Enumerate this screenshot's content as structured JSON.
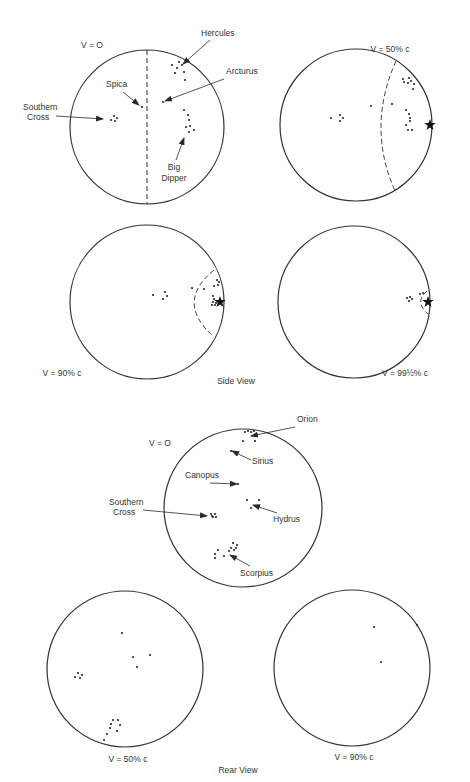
{
  "figure": {
    "side_view": {
      "caption": "Side View",
      "caption_pos": [
        236,
        384
      ],
      "panels": [
        {
          "id": "side-v0",
          "velocity_label": "V = O",
          "label_pos": [
            92,
            48
          ],
          "center": [
            147,
            127
          ],
          "radius": 77,
          "boundary": {
            "type": "line",
            "x1": 147,
            "y1": 50,
            "x2": 147,
            "y2": 204
          },
          "stars": [
            [
              111,
              120
            ],
            [
              114,
              116
            ],
            [
              117,
              118
            ],
            [
              115,
              121
            ],
            [
              142,
              107
            ],
            [
              163,
              102
            ],
            [
              172,
              65
            ],
            [
              179,
              62
            ],
            [
              182,
              65
            ],
            [
              177,
              68
            ],
            [
              184,
              72
            ],
            [
              175,
              73
            ],
            [
              185,
              80
            ],
            [
              184,
              110
            ],
            [
              188,
              115
            ],
            [
              189,
              120
            ],
            [
              190,
              126
            ],
            [
              186,
              127
            ],
            [
              189,
              132
            ],
            [
              194,
              130
            ]
          ],
          "bright_star": null,
          "labels": [
            {
              "text": "Hercules",
              "pos": [
                201,
                36
              ],
              "anchor": "start",
              "arrow": [
                [
                  210,
                  40
                ],
                [
                  183,
                  64
                ]
              ]
            },
            {
              "text": "Arcturus",
              "pos": [
                226,
                74
              ],
              "anchor": "start",
              "arrow": [
                [
                  224,
                  79
                ],
                [
                  165,
                  101
                ]
              ]
            },
            {
              "text": "Spica",
              "pos": [
                106,
                87
              ],
              "anchor": "start",
              "arrow": [
                [
                  123,
                  92
                ],
                [
                  139,
                  105
                ]
              ]
            },
            {
              "text": "Southern",
              "pos": [
                23,
                110
              ],
              "anchor": "start",
              "arrow": null
            },
            {
              "text": "Cross",
              "pos": [
                27,
                120
              ],
              "anchor": "start",
              "arrow": [
                [
                  56,
                  116
                ],
                [
                  103,
                  119
                ]
              ]
            },
            {
              "text": "Big",
              "pos": [
                174,
                170
              ],
              "anchor": "middle",
              "arrow": [
                [
                  176,
                  160
                ],
                [
                  184,
                  138
                ]
              ]
            },
            {
              "text": "Dipper",
              "pos": [
                174,
                181
              ],
              "anchor": "middle",
              "arrow": null
            }
          ]
        },
        {
          "id": "side-v50",
          "velocity_label": "V = 50% c",
          "label_pos": [
            390,
            52
          ],
          "center": [
            356,
            125
          ],
          "radius": 76,
          "boundary": {
            "type": "arc",
            "d": "M 396 61 Q 366 128 396 193"
          },
          "stars": [
            [
              331,
              118
            ],
            [
              340,
              115
            ],
            [
              343,
              118
            ],
            [
              340,
              121
            ],
            [
              371,
              106
            ],
            [
              392,
              104
            ],
            [
              403,
              79
            ],
            [
              409,
              78
            ],
            [
              411,
              81
            ],
            [
              408,
              83
            ],
            [
              414,
              84
            ],
            [
              404,
              82
            ],
            [
              413,
              89
            ],
            [
              406,
              110
            ],
            [
              409,
              114
            ],
            [
              410,
              118
            ],
            [
              410,
              121
            ],
            [
              406,
              125
            ],
            [
              408,
              130
            ],
            [
              412,
              130
            ]
          ],
          "bright_star": [
            430,
            125
          ],
          "labels": []
        },
        {
          "id": "side-v90",
          "velocity_label": "V = 90% c",
          "label_pos": [
            62,
            376
          ],
          "center": [
            147,
            302
          ],
          "radius": 77,
          "boundary": {
            "type": "arc",
            "d": "M 214 270 Q 175 302 213 336"
          },
          "stars": [
            [
              153,
              295
            ],
            [
              165,
              292
            ],
            [
              167,
              296
            ],
            [
              163,
              299
            ],
            [
              192,
              288
            ],
            [
              204,
              289
            ],
            [
              217,
              280
            ],
            [
              219,
              282
            ],
            [
              218,
              285
            ],
            [
              214,
              286
            ],
            [
              213,
              296
            ],
            [
              214,
              299
            ],
            [
              213,
              302
            ],
            [
              215,
              305
            ],
            [
              212,
              305
            ],
            [
              216,
              303
            ]
          ],
          "bright_star": [
            220,
            302
          ],
          "labels": []
        },
        {
          "id": "side-v995",
          "velocity_label": "V = 99½% c",
          "label_pos": [
            405,
            376
          ],
          "center": [
            354,
            302
          ],
          "radius": 76,
          "boundary": {
            "type": "arc",
            "d": "M 427 291 Q 414 302 428 314"
          },
          "stars": [
            [
              407,
              298
            ],
            [
              410,
              297
            ],
            [
              412,
              299
            ],
            [
              409,
              301
            ],
            [
              420,
              294
            ],
            [
              423,
              293
            ]
          ],
          "bright_star": [
            428,
            302
          ],
          "labels": []
        }
      ]
    },
    "rear_view": {
      "caption": "Rear View",
      "caption_pos": [
        238,
        773
      ],
      "panels": [
        {
          "id": "rear-v0",
          "velocity_label": "V = O",
          "label_pos": [
            160,
            446
          ],
          "center": [
            243,
            508
          ],
          "radius": 79,
          "stars": [
            [
              245,
              432
            ],
            [
              248,
              431
            ],
            [
              251,
              432
            ],
            [
              254,
              431
            ],
            [
              243,
              441
            ],
            [
              255,
              441
            ],
            [
              231,
              451
            ],
            [
              238,
              484
            ],
            [
              247,
              500
            ],
            [
              259,
              500
            ],
            [
              251,
              508
            ],
            [
              211,
              514
            ],
            [
              213,
              517
            ],
            [
              215,
              514
            ],
            [
              216,
              517
            ],
            [
              212,
              516
            ],
            [
              233,
              543
            ],
            [
              237,
              545
            ],
            [
              236,
              548
            ],
            [
              234,
              550
            ],
            [
              231,
              548
            ],
            [
              229,
              551
            ],
            [
              218,
              550
            ],
            [
              215,
              554
            ],
            [
              215,
              558
            ],
            [
              224,
              556
            ]
          ],
          "bright_star": null,
          "labels": [
            {
              "text": "Orion",
              "pos": [
                297,
                422
              ],
              "anchor": "start",
              "arrow": [
                [
                  295,
                  427
                ],
                [
                  251,
                  436
                ]
              ]
            },
            {
              "text": "Sirius",
              "pos": [
                252,
                464
              ],
              "anchor": "start",
              "arrow": [
                [
                  251,
                  460
                ],
                [
                  232,
                  451
                ]
              ]
            },
            {
              "text": "Canopus",
              "pos": [
                185,
                478
              ],
              "anchor": "start",
              "arrow": [
                [
                  210,
                  483
                ],
                [
                  237,
                  484
                ]
              ]
            },
            {
              "text": "Hydrus",
              "pos": [
                273,
                522
              ],
              "anchor": "start",
              "arrow": [
                [
                  277,
                  513
                ],
                [
                  253,
                  505
                ]
              ]
            },
            {
              "text": "Southern",
              "pos": [
                109,
                505
              ],
              "anchor": "start",
              "arrow": null
            },
            {
              "text": "Cross",
              "pos": [
                113,
                515
              ],
              "anchor": "start",
              "arrow": [
                [
                  143,
                  510
                ],
                [
                  207,
                  516
                ]
              ]
            },
            {
              "text": "Scorpius",
              "pos": [
                240,
                576
              ],
              "anchor": "start",
              "arrow": [
                [
                  250,
                  566
                ],
                [
                  230,
                  555
                ]
              ]
            }
          ]
        },
        {
          "id": "rear-v50",
          "velocity_label": "V = 50% c",
          "label_pos": [
            128,
            762
          ],
          "center": [
            125,
            669
          ],
          "radius": 78,
          "stars": [
            [
              122,
              633
            ],
            [
              133,
              657
            ],
            [
              150,
              655
            ],
            [
              137,
              667
            ],
            [
              75,
              677
            ],
            [
              78,
              673
            ],
            [
              82,
              675
            ],
            [
              80,
              678
            ],
            [
              113,
              720
            ],
            [
              118,
              720
            ],
            [
              120,
              725
            ],
            [
              117,
              731
            ],
            [
              110,
              728
            ],
            [
              107,
              734
            ],
            [
              111,
              724
            ],
            [
              104,
              740
            ]
          ],
          "bright_star": null,
          "labels": []
        },
        {
          "id": "rear-v90",
          "velocity_label": "V = 90% c",
          "label_pos": [
            354,
            760
          ],
          "center": [
            352,
            668
          ],
          "radius": 78,
          "stars": [
            [
              374,
              627
            ],
            [
              381,
              662
            ],
            [
              417,
              625
            ]
          ],
          "bright_star": null,
          "labels": []
        }
      ]
    }
  },
  "style": {
    "ink": "#2a2a2a",
    "circle_stroke": "#333333",
    "dash": "5,3"
  }
}
